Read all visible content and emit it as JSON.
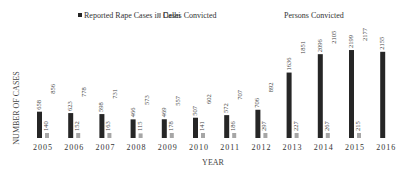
{
  "chart_data": {
    "type": "bar",
    "title": "",
    "xlabel": "YEAR",
    "ylabel": "NUMBER OF CASES",
    "categories": [
      "2005",
      "2006",
      "2007",
      "2008",
      "2009",
      "2010",
      "2011",
      "2012",
      "2013",
      "2014",
      "2015",
      "2016"
    ],
    "series": [
      {
        "name": "Reported Rape Cases in Delhi",
        "color": "#262626",
        "visible_bars": true,
        "values": [
          658,
          623,
          598,
          466,
          469,
          507,
          572,
          706,
          1636,
          2096,
          2199,
          2155
        ]
      },
      {
        "name": "Cases Convicted",
        "color": "#a6a6a6",
        "visible_bars": true,
        "values": [
          140,
          152,
          163,
          115,
          178,
          141,
          186,
          297,
          227,
          267,
          215,
          null
        ]
      },
      {
        "name": "Persons Convicted",
        "color": "#ffffff",
        "visible_bars": false,
        "values": [
          856,
          778,
          731,
          573,
          557,
          602,
          707,
          892,
          1851,
          2105,
          2177,
          null
        ]
      }
    ],
    "ylim": [
      0,
      2200
    ],
    "grid": false,
    "legend_position": "top-center",
    "data_labels": true,
    "label_rotation": "vertical"
  }
}
